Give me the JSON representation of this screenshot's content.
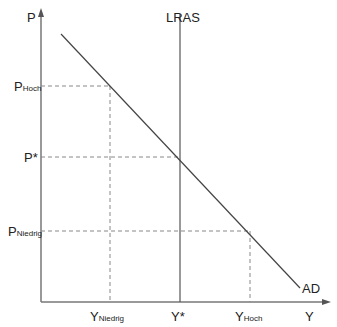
{
  "diagram": {
    "type": "AD-LRAS economic diagram",
    "axes": {
      "y_label": "P",
      "x_label": "Y"
    },
    "curves": {
      "lras_label": "LRAS",
      "ad_label": "AD"
    },
    "price_levels": {
      "high": {
        "main": "P",
        "sub": "Hoch"
      },
      "equilibrium": "P*",
      "low": {
        "main": "P",
        "sub": "Niedrig"
      }
    },
    "output_levels": {
      "low": {
        "main": "Y",
        "sub": "Niedrig"
      },
      "equilibrium": "Y*",
      "high": {
        "main": "Y",
        "sub": "Hoch"
      }
    },
    "colors": {
      "axis": "#777777",
      "curve": "#444444",
      "dashed": "#888888",
      "text": "#222222"
    }
  }
}
